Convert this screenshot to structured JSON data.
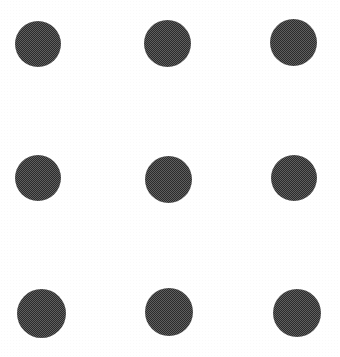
{
  "figure": {
    "background_color": "#ffffff",
    "dot_color": "#5f5f5f",
    "width": 340,
    "height": 357,
    "rows": 3,
    "columns": 3,
    "dot_count": 9,
    "texture": "checkerboard-halftone-dither"
  },
  "chart_data": {
    "type": "scatter",
    "title": "",
    "xlabel": "",
    "ylabel": "",
    "xlim": [
      0,
      340
    ],
    "ylim": [
      0,
      357
    ],
    "grid": false,
    "legend": null,
    "marker": "circle",
    "marker_color": "#5f5f5f",
    "series": [
      {
        "name": "dot-grid",
        "points": [
          {
            "id": "dot-r1c1",
            "row": 1,
            "col": 1,
            "cx": 38,
            "cy": 44,
            "d": 46
          },
          {
            "id": "dot-r1c2",
            "row": 1,
            "col": 2,
            "cx": 167,
            "cy": 43,
            "d": 47
          },
          {
            "id": "dot-r1c3",
            "row": 1,
            "col": 3,
            "cx": 293,
            "cy": 42,
            "d": 47
          },
          {
            "id": "dot-r2c1",
            "row": 2,
            "col": 1,
            "cx": 38,
            "cy": 178,
            "d": 46
          },
          {
            "id": "dot-r2c2",
            "row": 2,
            "col": 2,
            "cx": 168,
            "cy": 179,
            "d": 47
          },
          {
            "id": "dot-r2c3",
            "row": 2,
            "col": 3,
            "cx": 294,
            "cy": 178,
            "d": 46
          },
          {
            "id": "dot-r3c1",
            "row": 3,
            "col": 1,
            "cx": 41,
            "cy": 313,
            "d": 49
          },
          {
            "id": "dot-r3c2",
            "row": 3,
            "col": 2,
            "cx": 169,
            "cy": 312,
            "d": 48
          },
          {
            "id": "dot-r3c3",
            "row": 3,
            "col": 3,
            "cx": 297,
            "cy": 313,
            "d": 48
          }
        ]
      }
    ]
  }
}
